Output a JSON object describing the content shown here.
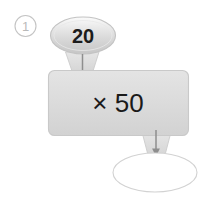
{
  "problem": {
    "number_label": "①",
    "number_plain": "1"
  },
  "machine": {
    "input_oval": {
      "value": "20",
      "icon": "oval-shape"
    },
    "operation_box": {
      "label": "× 50",
      "operator": "×",
      "operand": "50",
      "icon": "rounded-rectangle-shape"
    },
    "output_oval": {
      "value": "",
      "placeholder": "",
      "icon": "oval-shape"
    },
    "connectors": {
      "top_arrow": "arrow-down-icon",
      "bottom_arrow": "arrow-down-icon"
    }
  },
  "colors": {
    "background": "#ffffff",
    "shape_fill_light": "#f0f0f0",
    "shape_fill_mid": "#dcdcdc",
    "shape_fill_dark": "#cfcfcf",
    "shape_stroke": "#c9c9c9",
    "outline_stroke": "#d2d2d2",
    "arrow": "#8c8c8c",
    "text_dark": "#1a1a1a",
    "text_muted": "#b9b9b9",
    "shadow": "#d8d8d8"
  }
}
